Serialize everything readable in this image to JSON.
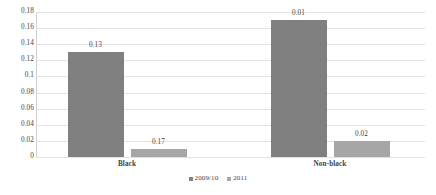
{
  "chart_data": {
    "type": "bar",
    "title": "",
    "subtitle": "",
    "xlabel": "",
    "ylabel": "",
    "categories": [
      "Black",
      "Non-black"
    ],
    "series": [
      {
        "name": "2009/10",
        "color": "#808080",
        "values": [
          0.13,
          0.17
        ]
      },
      {
        "name": "2011",
        "color": "#a6a6a6",
        "values": [
          0.01,
          0.02
        ]
      }
    ],
    "note_series_mapping": "Within each category the left bar is 2009/10 and the right bar is 2011.",
    "data_labels": {
      "Black": [
        "0.13",
        "0.17"
      ],
      "Non-black": [
        "0.01",
        "0.02"
      ]
    },
    "ylim": [
      0,
      0.18
    ],
    "ytick_values": [
      0,
      0.02,
      0.04,
      0.06,
      0.08,
      0.1,
      0.12,
      0.14,
      0.16,
      0.18
    ],
    "ytick_labels": [
      "0",
      "0.02",
      "0.04",
      "0.06",
      "0.08",
      "0.1",
      "0.12",
      "0.14",
      "0.16",
      "0.18"
    ],
    "grid": true,
    "grid_color": "#e2e2e2",
    "legend_position": "bottom-center",
    "background_color": "#ffffff",
    "text_color": "#3f3f3f"
  },
  "legend": {
    "entries": [
      {
        "label": "2009/10",
        "color": "#808080"
      },
      {
        "label": "2011",
        "color": "#a6a6a6"
      }
    ]
  },
  "axis": {
    "category_labels": [
      "Black",
      "Non-black"
    ]
  }
}
